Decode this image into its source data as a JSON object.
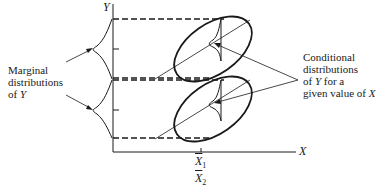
{
  "diagram": {
    "axes": {
      "y_label": "Y",
      "x_label": "X"
    },
    "annotations": {
      "marginal": {
        "line1": "Marginal",
        "line2": "distributions",
        "line3_prefix": "of ",
        "line3_var": "Y"
      },
      "conditional": {
        "line1": "Conditional",
        "line2": "distributions",
        "line3_prefix": "of ",
        "line3_var": "Y",
        "line3_suffix": " for a",
        "line4_prefix": "given value of ",
        "line4_var": "X"
      }
    },
    "x_ticks": [
      {
        "symbol": "X",
        "subscript": "1"
      },
      {
        "symbol": "X",
        "subscript": "2"
      }
    ],
    "colors": {
      "ink": "#1a1a1a",
      "background": "#ffffff"
    }
  }
}
